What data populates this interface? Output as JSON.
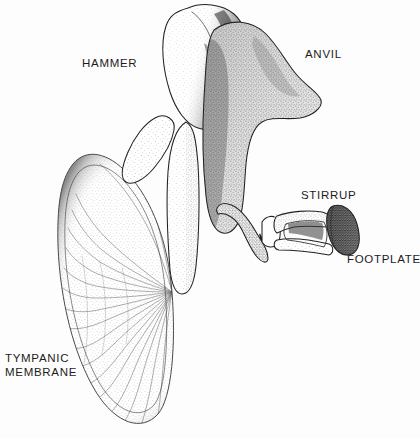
{
  "figure": {
    "style": "stippled pen-and-ink anatomical line drawing",
    "background_color": "#fdfdfd",
    "ink_color": "#222222",
    "label_color": "#1c1c1c",
    "width": 420,
    "height": 438
  },
  "labels": [
    {
      "id": "hammer",
      "text": "HAMMER",
      "x": 82,
      "y": 61,
      "anatomical_name": "malleus",
      "lines": [
        "HAMMER"
      ]
    },
    {
      "id": "anvil",
      "text": "ANVIL",
      "x": 305,
      "y": 52,
      "anatomical_name": "incus",
      "lines": [
        "ANVIL"
      ]
    },
    {
      "id": "stirrup",
      "text": "STIRRUP",
      "x": 301,
      "y": 193,
      "anatomical_name": "stapes",
      "lines": [
        "STIRRUP"
      ]
    },
    {
      "id": "footplate",
      "text": "FOOTPLATE",
      "x": 347,
      "y": 257,
      "anatomical_name": "stapes footplate",
      "lines": [
        "FOOTPLATE"
      ]
    },
    {
      "id": "tympanic-membrane",
      "text": "TYMPANIC\nMEMBRANE",
      "x": 5,
      "y": 355,
      "anatomical_name": "tympanic membrane",
      "lines": [
        "TYMPANIC",
        "MEMBRANE"
      ]
    }
  ],
  "structures": [
    {
      "id": "malleus-head",
      "name": "hammer head",
      "bounds": {
        "x": 150,
        "y": 3,
        "width": 100,
        "height": 120
      },
      "shading": "heavy stipple on right flank"
    },
    {
      "id": "malleus-manubrium",
      "name": "hammer handle",
      "bounds": {
        "x": 150,
        "y": 120,
        "width": 60,
        "height": 175
      },
      "shading": "light stipple, descends to umbo"
    },
    {
      "id": "incus-body",
      "name": "anvil body",
      "bounds": {
        "x": 205,
        "y": 20,
        "width": 120,
        "height": 215
      },
      "shading": "uniform medium stipple with pointed short process"
    },
    {
      "id": "stapes-arch",
      "name": "stirrup arch",
      "bounds": {
        "x": 256,
        "y": 206,
        "width": 80,
        "height": 50
      },
      "shading": "open triangular crura"
    },
    {
      "id": "stapes-footplate",
      "name": "footplate",
      "bounds": {
        "x": 326,
        "y": 204,
        "width": 36,
        "height": 52
      },
      "shading": "dense dark stipple, flared oval"
    },
    {
      "id": "tympanic-membrane-shape",
      "name": "tympanic membrane",
      "bounds": {
        "x": 60,
        "y": 150,
        "width": 128,
        "height": 278
      },
      "shading": "radial fibers converging at umbo"
    }
  ],
  "umbo": {
    "x": 172,
    "y": 292,
    "description": "convergence point of radial fibers"
  }
}
